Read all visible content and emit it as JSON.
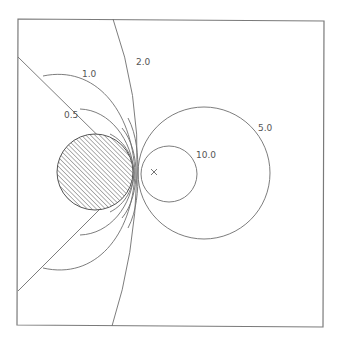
{
  "diagram": {
    "frame": {
      "x1": 18,
      "y1": 19,
      "x2": 323,
      "y2": 326
    },
    "obstacle": {
      "type": "hatched-circle",
      "cx": 95,
      "cy": 172,
      "r": 38
    },
    "source_marker": {
      "symbol": "×",
      "x": 154,
      "y": 172
    },
    "contours": [
      {
        "value": "0.5",
        "label": "0.5",
        "label_x": 64,
        "label_y": 118
      },
      {
        "value": "1.0",
        "label": "1.0",
        "label_x": 82,
        "label_y": 77
      },
      {
        "value": "2.0",
        "label": "2.0",
        "label_x": 136,
        "label_y": 65
      },
      {
        "value": "5.0",
        "label": "5.0",
        "label_x": 258,
        "label_y": 131
      },
      {
        "value": "10.0",
        "label": "10.0",
        "label_x": 196,
        "label_y": 158
      }
    ],
    "wedge_lines": [
      {
        "from": [
          18,
          57
        ],
        "to": [
          133,
          170
        ]
      },
      {
        "from": [
          18,
          290
        ],
        "to": [
          133,
          176
        ]
      }
    ]
  }
}
